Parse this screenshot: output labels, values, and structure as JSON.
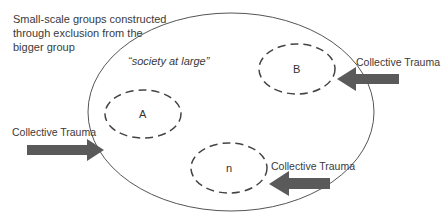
{
  "diagram": {
    "title_lines": [
      "Small-scale groups constructed",
      "through exclusion from the",
      "bigger group"
    ],
    "outer_group_label": "“society at large”",
    "groups": [
      {
        "id": "A",
        "label": "A"
      },
      {
        "id": "B",
        "label": "B"
      },
      {
        "id": "n",
        "label": "n"
      }
    ],
    "arrows": [
      {
        "label": "Collective Trauma",
        "target": "outer"
      },
      {
        "label": "Collective Trauma",
        "target": "B"
      },
      {
        "label": "Collective Trauma",
        "target": "n"
      }
    ],
    "colors": {
      "outline": "#555555",
      "arrow_fill": "#5a5a5a",
      "text": "#3a3a3a"
    }
  }
}
